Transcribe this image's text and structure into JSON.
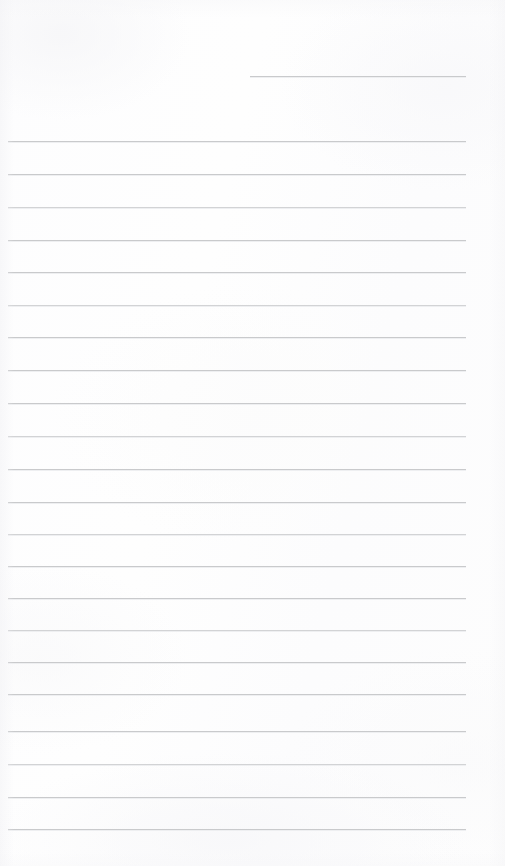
{
  "document": {
    "type": "lined-notebook-paper",
    "title": "Blank ruled notepad page",
    "content_text": "",
    "has_handwriting": false,
    "has_printed_text": false,
    "page_width": 505,
    "page_height": 866
  },
  "colors": {
    "paper_background": "#fdfdfd",
    "rule_line": "#c9cacc",
    "rule_line_faint": "#d2d3d5",
    "page_edge": "#ffffff"
  },
  "layout": {
    "left_margin_x": 8,
    "right_margin_x": 465,
    "line_spacing": 32.2,
    "line_thickness": 1
  },
  "ruled_lines": [
    {
      "id": "header-rule",
      "y": 76,
      "x1": 250,
      "x2": 466,
      "style": "partial"
    },
    {
      "id": "rule-01",
      "y": 141,
      "x1": 8,
      "x2": 466,
      "style": "normal"
    },
    {
      "id": "rule-02",
      "y": 174,
      "x1": 8,
      "x2": 466,
      "style": "normal"
    },
    {
      "id": "rule-03",
      "y": 207,
      "x1": 8,
      "x2": 466,
      "style": "faint"
    },
    {
      "id": "rule-04",
      "y": 240,
      "x1": 8,
      "x2": 466,
      "style": "normal"
    },
    {
      "id": "rule-05",
      "y": 272,
      "x1": 8,
      "x2": 466,
      "style": "normal"
    },
    {
      "id": "rule-06",
      "y": 305,
      "x1": 8,
      "x2": 466,
      "style": "faint"
    },
    {
      "id": "rule-07",
      "y": 337,
      "x1": 8,
      "x2": 466,
      "style": "normal"
    },
    {
      "id": "rule-08",
      "y": 370,
      "x1": 8,
      "x2": 466,
      "style": "normal"
    },
    {
      "id": "rule-09",
      "y": 403,
      "x1": 8,
      "x2": 466,
      "style": "normal"
    },
    {
      "id": "rule-10",
      "y": 436,
      "x1": 8,
      "x2": 466,
      "style": "faint"
    },
    {
      "id": "rule-11",
      "y": 469,
      "x1": 8,
      "x2": 466,
      "style": "normal"
    },
    {
      "id": "rule-12",
      "y": 502,
      "x1": 8,
      "x2": 466,
      "style": "normal"
    },
    {
      "id": "rule-13",
      "y": 534,
      "x1": 8,
      "x2": 466,
      "style": "faint"
    },
    {
      "id": "rule-14",
      "y": 566,
      "x1": 8,
      "x2": 466,
      "style": "normal"
    },
    {
      "id": "rule-15",
      "y": 598,
      "x1": 8,
      "x2": 466,
      "style": "normal"
    },
    {
      "id": "rule-16",
      "y": 630,
      "x1": 8,
      "x2": 466,
      "style": "faint"
    },
    {
      "id": "rule-17",
      "y": 662,
      "x1": 8,
      "x2": 466,
      "style": "normal"
    },
    {
      "id": "rule-18",
      "y": 694,
      "x1": 8,
      "x2": 466,
      "style": "normal"
    },
    {
      "id": "rule-19",
      "y": 731,
      "x1": 8,
      "x2": 466,
      "style": "normal"
    },
    {
      "id": "rule-20",
      "y": 764,
      "x1": 8,
      "x2": 466,
      "style": "faint"
    },
    {
      "id": "rule-21",
      "y": 797,
      "x1": 8,
      "x2": 466,
      "style": "normal"
    },
    {
      "id": "rule-22",
      "y": 829,
      "x1": 8,
      "x2": 466,
      "style": "normal"
    }
  ]
}
